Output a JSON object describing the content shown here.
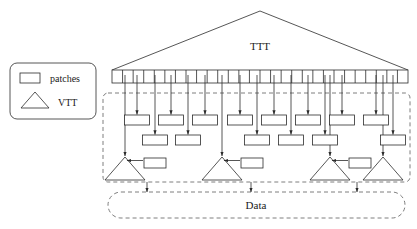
{
  "figure": {
    "labels": {
      "ttt": "TTT",
      "data": "Data"
    }
  },
  "legend": {
    "items": [
      {
        "shape": "rectangle",
        "label": "patches"
      },
      {
        "shape": "triangle",
        "label": "VTT"
      }
    ]
  },
  "top_module": {
    "name": "TTT",
    "token_bar": {
      "cell_count": 28,
      "x": 112,
      "y": 70,
      "width": 296,
      "height": 13
    }
  },
  "patch_row_upper": {
    "count": 8,
    "centers_x": [
      137,
      171,
      205,
      240,
      274,
      308,
      342,
      376
    ],
    "y": 115,
    "width": 25,
    "height": 10
  },
  "patch_row_lower": {
    "count": 6,
    "centers_x": [
      155,
      188,
      257,
      291,
      325,
      393
    ],
    "y": 135,
    "width": 25,
    "height": 10
  },
  "vtt_units": [
    {
      "apex_x": 125,
      "has_patch": true,
      "patch_x": 138
    },
    {
      "apex_x": 222,
      "has_patch": true,
      "patch_x": 235
    },
    {
      "apex_x": 330,
      "has_patch": true,
      "patch_x": 343
    },
    {
      "apex_x": 383,
      "has_patch": false,
      "patch_x": 0
    }
  ],
  "data_store": {
    "label": "Data",
    "arrow_sources_x": [
      147,
      251,
      357
    ]
  },
  "colors": {
    "stroke": "#2b2b2b",
    "dashed_stroke": "#6f6f6f",
    "background": "#ffffff",
    "text": "#1a1a1a"
  }
}
